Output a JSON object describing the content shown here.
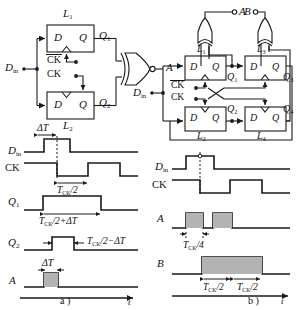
{
  "figure": {
    "caption_a": "a )",
    "caption_b": "b )"
  },
  "circuit_a": {
    "name": "two-latch divider with XNOR output",
    "input_label": "D",
    "input_sub": "in",
    "clock_labels": [
      "CK",
      "CK"
    ],
    "clock_bar_on_first": true,
    "latches": [
      {
        "id": "L1",
        "label": "L",
        "sub": "1",
        "d_label": "D",
        "q_label": "Q",
        "out_label": "Q",
        "out_sub": "1"
      },
      {
        "id": "L2",
        "label": "L",
        "sub": "2",
        "d_label": "D",
        "q_label": "Q",
        "out_label": "Q",
        "out_sub": "2"
      }
    ],
    "gate": {
      "type": "xnor-gate",
      "output_label": "A"
    }
  },
  "circuit_b": {
    "name": "four-latch divider with two XOR outputs",
    "input_label": "D",
    "input_sub": "in",
    "clock_labels": [
      "CK",
      "CK"
    ],
    "clock_bar_on_first": true,
    "latches": [
      {
        "id": "L1",
        "label": "L",
        "sub": "1",
        "d_label": "D",
        "q_label": "Q",
        "out_label": "Q",
        "out_sub": "1"
      },
      {
        "id": "L3",
        "label": "L",
        "sub": "3",
        "d_label": "D",
        "q_label": "Q",
        "out_label": "Q",
        "out_sub": "3"
      },
      {
        "id": "L2",
        "label": "L",
        "sub": "2",
        "d_label": "D",
        "q_label": "Q",
        "out_label": "Q",
        "out_sub": "2"
      },
      {
        "id": "L4",
        "label": "L",
        "sub": "4",
        "d_label": "D",
        "q_label": "Q",
        "out_label": "Q",
        "out_sub": "4"
      }
    ],
    "gates": [
      {
        "type": "xor-gate",
        "output_label": "A"
      },
      {
        "type": "xor-gate",
        "output_label": "B"
      }
    ]
  },
  "timing_a": {
    "axis_label": "t",
    "signals": [
      {
        "name": "Din",
        "label": "D",
        "sub": "in"
      },
      {
        "name": "CK",
        "label": "CK",
        "sub": ""
      },
      {
        "name": "Q1",
        "label": "Q",
        "sub": "1"
      },
      {
        "name": "Q2",
        "label": "Q",
        "sub": "2"
      },
      {
        "name": "A",
        "label": "A",
        "sub": ""
      }
    ],
    "annotations": [
      {
        "id": "delta-t-top",
        "text": "ΔT"
      },
      {
        "id": "tck-half",
        "text": "T",
        "sub": "CK",
        "tail": "/2"
      },
      {
        "id": "tck-half-plus",
        "text": "T",
        "sub": "CK",
        "tail": "/2+ΔT"
      },
      {
        "id": "tck-half-minus",
        "text": "T",
        "sub": "CK",
        "tail": "/2−ΔT"
      },
      {
        "id": "delta-t-a",
        "text": "ΔT"
      }
    ]
  },
  "timing_b": {
    "axis_label": "t",
    "signals": [
      {
        "name": "Din",
        "label": "D",
        "sub": "in"
      },
      {
        "name": "CK",
        "label": "CK",
        "sub": ""
      },
      {
        "name": "A",
        "label": "A",
        "sub": ""
      },
      {
        "name": "B",
        "label": "B",
        "sub": ""
      }
    ],
    "annotations": [
      {
        "id": "tck-quarter",
        "text": "T",
        "sub": "CK",
        "tail": "/4"
      },
      {
        "id": "tck-half-b1",
        "text": "T",
        "sub": "CK",
        "tail": "/2"
      },
      {
        "id": "tck-half-b2",
        "text": "T",
        "sub": "CK",
        "tail": "/2"
      }
    ]
  },
  "style": {
    "line_color": "#1a1a1a",
    "fill_gray": "#b3b3b3",
    "background": "#ffffff"
  }
}
